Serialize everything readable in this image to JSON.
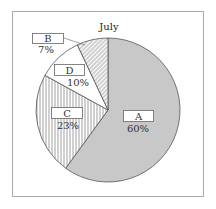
{
  "chart_data": {
    "type": "pie",
    "title": "July",
    "start_angle": "12 o'clock",
    "direction": "clockwise",
    "slices": [
      {
        "label": "A",
        "value": 60,
        "value_label": "60%",
        "fill": "#c8c8c8",
        "pattern": "solid"
      },
      {
        "label": "C",
        "value": 23,
        "value_label": "23%",
        "fill": "#ffffff",
        "pattern": "vertical-lines"
      },
      {
        "label": "D",
        "value": 10,
        "value_label": "10%",
        "fill": "#ffffff",
        "pattern": "none"
      },
      {
        "label": "B",
        "value": 7,
        "value_label": "7%",
        "fill": "#ffffff",
        "pattern": "diagonal-lines"
      }
    ],
    "categories": [
      "A",
      "C",
      "D",
      "B"
    ],
    "values": [
      60,
      23,
      10,
      7
    ],
    "legend": "none (labels in boxes on slices)"
  },
  "colors": {
    "frame": "#aaaaaa",
    "outline": "#555555",
    "slice_a": "#c8c8c8",
    "hatch": "#777777"
  }
}
